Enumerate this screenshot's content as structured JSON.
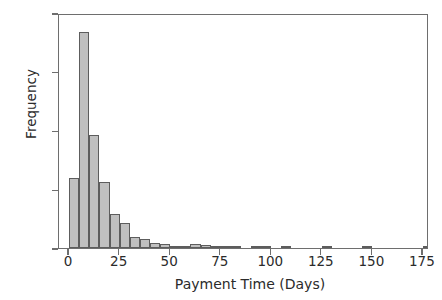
{
  "chart_data": {
    "type": "bar",
    "title": "",
    "xlabel": "Payment Time (Days)",
    "ylabel": "Frequency",
    "xlim": [
      -5,
      178
    ],
    "ylim": [
      0,
      400
    ],
    "bin_width": 5,
    "grid": false,
    "legend": null,
    "xticks": [
      0,
      25,
      50,
      75,
      100,
      125,
      150,
      175
    ],
    "xtick_labels": [
      "0",
      "25",
      "50",
      "75",
      "100",
      "125",
      "150",
      "175"
    ],
    "yticks": [
      0,
      100,
      200,
      300,
      400
    ],
    "ytick_labels": [
      "0",
      "100",
      "200",
      "300",
      "400"
    ],
    "bin_starts": [
      0,
      5,
      10,
      15,
      20,
      25,
      30,
      35,
      40,
      45,
      50,
      55,
      60,
      65,
      70,
      75,
      80,
      85,
      90,
      95,
      100,
      105,
      110,
      115,
      120,
      125,
      130,
      135,
      140,
      145,
      150,
      155,
      160,
      165,
      170,
      175
    ],
    "categories": [
      "0-5",
      "5-10",
      "10-15",
      "15-20",
      "20-25",
      "25-30",
      "30-35",
      "35-40",
      "40-45",
      "45-50",
      "50-55",
      "55-60",
      "60-65",
      "65-70",
      "70-75",
      "75-80",
      "80-85",
      "85-90",
      "90-95",
      "95-100",
      "100-105",
      "105-110",
      "110-115",
      "115-120",
      "120-125",
      "125-130",
      "130-135",
      "135-140",
      "140-145",
      "145-150",
      "150-155",
      "155-160",
      "160-165",
      "165-170",
      "170-175",
      "175-180"
    ],
    "values": [
      120,
      368,
      193,
      112,
      58,
      42,
      18,
      16,
      9,
      7,
      4,
      3,
      6,
      5,
      2,
      1,
      1,
      0,
      1,
      1,
      0,
      1,
      0,
      0,
      0,
      1,
      0,
      0,
      0,
      2,
      0,
      0,
      0,
      0,
      0,
      1
    ],
    "colors": {
      "bar_fill": "#c0c0c0",
      "bar_edge": "#5d5d5d",
      "axis": "#6e6e6e",
      "text": "#2b2b2b",
      "background": "#ffffff"
    }
  }
}
